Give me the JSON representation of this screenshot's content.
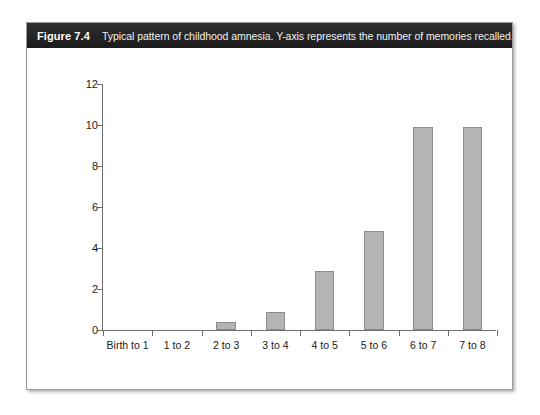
{
  "figure": {
    "label": "Figure 7.4",
    "caption": "Typical pattern of childhood amnesia. Y-axis represents the number of memories recalled.",
    "frame_color": "#9a9a9a",
    "caption_bar_color": "#272727",
    "caption_text_color": "#ffffff"
  },
  "chart_data": {
    "type": "bar",
    "title": "",
    "subtitle": "",
    "categories": [
      "Birth to 1",
      "1 to 2",
      "2 to 3",
      "3 to 4",
      "4 to 5",
      "5 to 6",
      "6 to 7",
      "7 to 8"
    ],
    "values": [
      0,
      0,
      0.4,
      0.9,
      2.9,
      4.85,
      9.9,
      9.9
    ],
    "xlabel": "",
    "ylabel": "",
    "ylim": [
      0,
      12
    ],
    "yticks": [
      0,
      2,
      4,
      6,
      8,
      10,
      12
    ],
    "ytick_labels": [
      "0",
      "2",
      "4",
      "6",
      "8",
      "10",
      "12"
    ],
    "grid": false,
    "legend": false,
    "bar_color": "#b4b4b4",
    "bar_edge_color": "#8c8c8c",
    "axis_color": "#6f6f6f"
  }
}
